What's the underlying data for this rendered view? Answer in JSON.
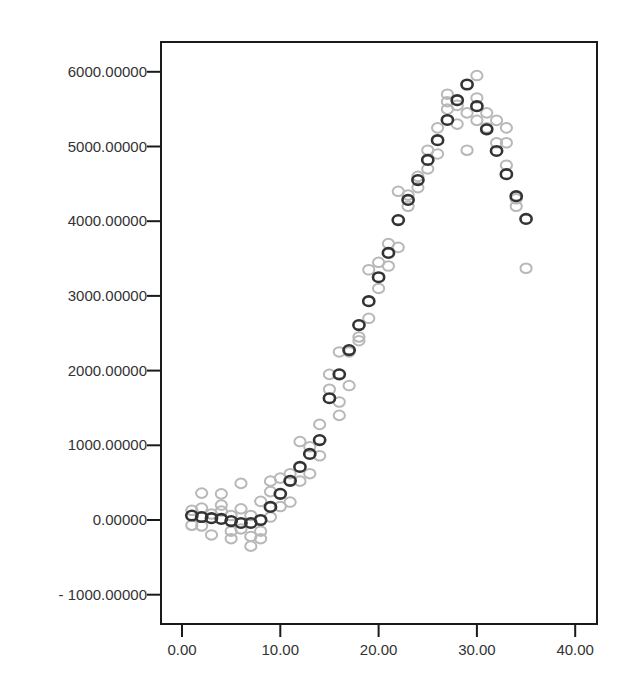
{
  "chart_data": {
    "type": "scatter",
    "title": "",
    "xlabel": "",
    "ylabel": "",
    "xlim": [
      -2.2,
      42.2
    ],
    "ylim": [
      -1400,
      6400
    ],
    "x_ticks": [
      0,
      10,
      20,
      30,
      40
    ],
    "x_tick_labels": [
      "0.00",
      "10.00",
      "20.00",
      "30.00",
      "40.00"
    ],
    "y_ticks": [
      6000,
      5000,
      4000,
      3000,
      2000,
      1000,
      0,
      -1000
    ],
    "y_tick_labels": [
      "6000.00000",
      "5000.00000",
      "4000.00000",
      "3000.00000",
      "2000.00000",
      "1000.00000",
      "0.00000",
      "- 1000.00000"
    ],
    "grid": false,
    "legend": null,
    "series": [
      {
        "name": "observed",
        "color": "#b8b8b8",
        "marker": "open-circle",
        "points": [
          [
            1,
            -70
          ],
          [
            1,
            130
          ],
          [
            2,
            360
          ],
          [
            2,
            160
          ],
          [
            2,
            -80
          ],
          [
            3,
            80
          ],
          [
            3,
            -200
          ],
          [
            4,
            350
          ],
          [
            4,
            200
          ],
          [
            4,
            120
          ],
          [
            5,
            -150
          ],
          [
            5,
            60
          ],
          [
            5,
            -250
          ],
          [
            6,
            490
          ],
          [
            6,
            -120
          ],
          [
            6,
            150
          ],
          [
            7,
            -220
          ],
          [
            7,
            -350
          ],
          [
            7,
            60
          ],
          [
            8,
            250
          ],
          [
            8,
            -150
          ],
          [
            8,
            -250
          ],
          [
            9,
            520
          ],
          [
            9,
            380
          ],
          [
            9,
            40
          ],
          [
            10,
            560
          ],
          [
            10,
            180
          ],
          [
            11,
            620
          ],
          [
            11,
            240
          ],
          [
            12,
            1050
          ],
          [
            12,
            520
          ],
          [
            13,
            980
          ],
          [
            13,
            620
          ],
          [
            14,
            1280
          ],
          [
            14,
            860
          ],
          [
            15,
            1950
          ],
          [
            15,
            1750
          ],
          [
            16,
            1580
          ],
          [
            16,
            2250
          ],
          [
            16,
            1400
          ],
          [
            17,
            2250
          ],
          [
            17,
            1800
          ],
          [
            18,
            2400
          ],
          [
            18,
            2450
          ],
          [
            19,
            3350
          ],
          [
            19,
            2700
          ],
          [
            20,
            3450
          ],
          [
            20,
            3100
          ],
          [
            21,
            3700
          ],
          [
            21,
            3400
          ],
          [
            22,
            4400
          ],
          [
            22,
            3650
          ],
          [
            23,
            4350
          ],
          [
            23,
            4200
          ],
          [
            24,
            4600
          ],
          [
            24,
            4450
          ],
          [
            25,
            4950
          ],
          [
            25,
            4700
          ],
          [
            26,
            5250
          ],
          [
            26,
            4900
          ],
          [
            27,
            5600
          ],
          [
            27,
            5500
          ],
          [
            27,
            5700
          ],
          [
            28,
            5550
          ],
          [
            28,
            5300
          ],
          [
            29,
            5450
          ],
          [
            29,
            4950
          ],
          [
            30,
            5950
          ],
          [
            30,
            5650
          ],
          [
            30,
            5350
          ],
          [
            31,
            5450
          ],
          [
            31,
            5250
          ],
          [
            32,
            5350
          ],
          [
            32,
            5050
          ],
          [
            33,
            5250
          ],
          [
            33,
            4750
          ],
          [
            33,
            5050
          ],
          [
            34,
            4300
          ],
          [
            34,
            4200
          ],
          [
            35,
            3370
          ]
        ]
      },
      {
        "name": "fitted",
        "color": "#333333",
        "marker": "open-circle",
        "points": [
          [
            1,
            60
          ],
          [
            2,
            40
          ],
          [
            3,
            25
          ],
          [
            4,
            15
          ],
          [
            5,
            -15
          ],
          [
            6,
            -40
          ],
          [
            7,
            -40
          ],
          [
            8,
            0
          ],
          [
            9,
            175
          ],
          [
            10,
            350
          ],
          [
            11,
            525
          ],
          [
            12,
            710
          ],
          [
            13,
            885
          ],
          [
            14,
            1070
          ],
          [
            15,
            1630
          ],
          [
            16,
            1950
          ],
          [
            17,
            2275
          ],
          [
            18,
            2610
          ],
          [
            19,
            2930
          ],
          [
            20,
            3250
          ],
          [
            21,
            3575
          ],
          [
            22,
            4015
          ],
          [
            23,
            4285
          ],
          [
            24,
            4550
          ],
          [
            25,
            4820
          ],
          [
            26,
            5085
          ],
          [
            27,
            5355
          ],
          [
            28,
            5620
          ],
          [
            29,
            5830
          ],
          [
            30,
            5540
          ],
          [
            31,
            5230
          ],
          [
            32,
            4940
          ],
          [
            33,
            4630
          ],
          [
            34,
            4335
          ],
          [
            35,
            4030
          ]
        ]
      }
    ],
    "layout": {
      "plot_left": 161,
      "plot_top": 42,
      "plot_right": 597,
      "plot_bottom": 624,
      "x0_px": 182,
      "x_px_per_unit": 9.83,
      "y0_px": 520,
      "y_px_per_unit": 0.0747
    }
  }
}
